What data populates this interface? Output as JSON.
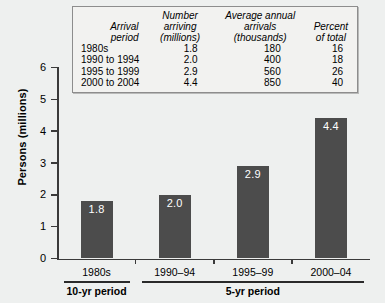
{
  "chart_data": {
    "type": "bar",
    "title": "",
    "xlabel": "",
    "ylabel": "Persons (millions)",
    "ylim": [
      0,
      6
    ],
    "yticks": [
      "0",
      "1",
      "2",
      "3",
      "4",
      "5",
      "6"
    ],
    "grid": false,
    "legend": "none",
    "categories": [
      "1980s",
      "1990–94",
      "1995–99",
      "2000–04"
    ],
    "values": [
      1.8,
      2.0,
      2.9,
      4.4
    ],
    "value_labels": [
      "1.8",
      "2.0",
      "2.9",
      "4.4"
    ],
    "bar_color": "#4c4c4c",
    "value_label_color": "#ffffff",
    "background_color": "#eef0ef",
    "groups": [
      {
        "label": "10-yr period",
        "categories": [
          "1980s"
        ]
      },
      {
        "label": "5-yr period",
        "categories": [
          "1990–94",
          "1995–99",
          "2000–04"
        ]
      }
    ],
    "table": {
      "headers": [
        {
          "line1": "Arrival",
          "line2": "period"
        },
        {
          "line1": "Number arriving",
          "line2": "(millions)"
        },
        {
          "line1": "Average annual",
          "line2": "arrivals (thousands)"
        },
        {
          "line1": "Percent",
          "line2": "of total"
        }
      ],
      "rows": [
        {
          "period": "1980s",
          "millions": "1.8",
          "annual_thousands": "180",
          "percent": "16"
        },
        {
          "period": "1990 to 1994",
          "millions": "2.0",
          "annual_thousands": "400",
          "percent": "18"
        },
        {
          "period": "1995 to 1999",
          "millions": "2.9",
          "annual_thousands": "560",
          "percent": "26"
        },
        {
          "period": "2000 to 2004",
          "millions": "4.4",
          "annual_thousands": "850",
          "percent": "40"
        }
      ]
    }
  }
}
